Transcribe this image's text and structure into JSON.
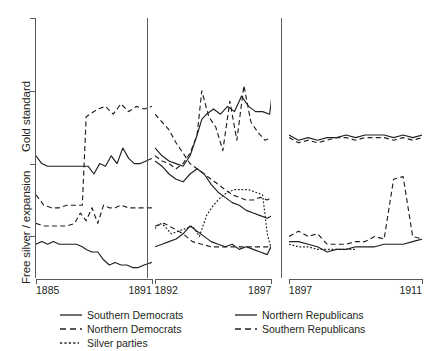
{
  "chart_data": {
    "type": "line",
    "title": "",
    "subtitle": "",
    "xlabel": "",
    "ylabel_top": "Gold standard",
    "ylabel_bottom": "Free silver / expansion",
    "ylim": [
      0,
      1
    ],
    "grid": false,
    "legend_position": "bottom",
    "axis": {
      "y_ticks": [
        1.0,
        0.72,
        0.44,
        0.16
      ],
      "y_tick_labels": [
        "",
        "",
        "",
        ""
      ],
      "y_axis_note": "Unlabeled ordinal scale: top = Gold standard, bottom = Free silver / expansion"
    },
    "panels": [
      {
        "name": "panel-1885-1891",
        "x_start_label": "1885",
        "x_end_label": "1891",
        "xlim": [
          1885,
          1891
        ],
        "series": [
          {
            "name": "Southern Democrats",
            "style": "solid",
            "x": [
              1885.0,
              1885.3,
              1885.6,
              1885.9,
              1886.2,
              1886.5,
              1886.8,
              1887.1,
              1887.4,
              1887.7,
              1888.0,
              1888.3,
              1888.6,
              1888.9,
              1889.2,
              1889.5,
              1889.8,
              1890.1,
              1890.4,
              1890.7,
              1891.0
            ],
            "values": [
              0.47,
              0.44,
              0.43,
              0.43,
              0.43,
              0.43,
              0.43,
              0.43,
              0.43,
              0.43,
              0.4,
              0.44,
              0.43,
              0.47,
              0.44,
              0.5,
              0.46,
              0.44,
              0.44,
              0.45,
              0.46
            ]
          },
          {
            "name": "Northern Democrats",
            "style": "dashed",
            "x": [
              1885.0,
              1885.4,
              1885.8,
              1886.2,
              1886.6,
              1887.0,
              1887.4,
              1887.6,
              1887.8,
              1888.2,
              1888.6,
              1889.0,
              1889.4,
              1889.8,
              1890.2,
              1890.6,
              1891.0
            ],
            "values": [
              0.32,
              0.28,
              0.27,
              0.27,
              0.28,
              0.28,
              0.28,
              0.62,
              0.63,
              0.65,
              0.66,
              0.63,
              0.67,
              0.64,
              0.66,
              0.65,
              0.66
            ]
          },
          {
            "name": "Northern Republicans",
            "style": "solid",
            "x": [],
            "values": []
          },
          {
            "name": "Southern Republicans",
            "style": "dashed",
            "x": [],
            "values": []
          },
          {
            "name": "Silver parties",
            "style": "dotted",
            "x": [],
            "values": []
          }
        ],
        "lower_series": [
          {
            "name": "Northern Democrats",
            "style": "dashed",
            "x": [
              1885.0,
              1885.4,
              1885.8,
              1886.2,
              1886.6,
              1887.0,
              1887.3,
              1887.6,
              1887.9,
              1888.2,
              1888.5,
              1888.8,
              1889.1,
              1889.4,
              1889.8,
              1890.2,
              1890.6,
              1891.0
            ],
            "values": [
              0.21,
              0.2,
              0.2,
              0.2,
              0.2,
              0.21,
              0.25,
              0.22,
              0.27,
              0.21,
              0.28,
              0.27,
              0.27,
              0.28,
              0.27,
              0.27,
              0.27,
              0.27
            ]
          },
          {
            "name": "Southern Democrats",
            "style": "solid",
            "x": [
              1885.0,
              1885.3,
              1885.6,
              1885.9,
              1886.2,
              1886.5,
              1886.8,
              1887.1,
              1887.4,
              1887.6,
              1887.9,
              1888.2,
              1888.5,
              1888.8,
              1889.1,
              1889.4,
              1889.7,
              1890.0,
              1890.3,
              1890.6,
              1891.0
            ],
            "values": [
              0.13,
              0.14,
              0.13,
              0.14,
              0.13,
              0.13,
              0.13,
              0.13,
              0.12,
              0.11,
              0.1,
              0.1,
              0.07,
              0.05,
              0.06,
              0.05,
              0.05,
              0.04,
              0.04,
              0.05,
              0.06
            ]
          }
        ]
      },
      {
        "name": "panel-1892-1897",
        "x_start_label": "1892",
        "x_end_label": "1897",
        "xlim": [
          1892,
          1897
        ],
        "series": [
          {
            "name": "Southern Republicans",
            "style": "dashed",
            "x": [
              1892.0,
              1892.3,
              1892.6,
              1892.9,
              1893.2,
              1893.5,
              1893.8,
              1894.1,
              1894.4,
              1894.7,
              1895.0,
              1895.3,
              1895.6,
              1895.9,
              1896.2,
              1896.5,
              1896.8,
              1897.0
            ],
            "values": [
              0.63,
              0.6,
              0.57,
              0.52,
              0.48,
              0.44,
              0.42,
              0.4,
              0.38,
              0.36,
              0.34,
              0.32,
              0.31,
              0.3,
              0.3,
              0.31,
              0.3,
              0.31
            ]
          },
          {
            "name": "Northern Republicans",
            "style": "solid",
            "x": [
              1892.0,
              1892.3,
              1892.6,
              1892.9,
              1893.2,
              1893.5,
              1893.8,
              1894.0,
              1894.2,
              1894.5,
              1894.8,
              1895.1,
              1895.4,
              1895.7,
              1896.0,
              1896.3,
              1896.6,
              1896.9,
              1897.0
            ],
            "values": [
              0.5,
              0.47,
              0.45,
              0.44,
              0.43,
              0.47,
              0.55,
              0.61,
              0.63,
              0.65,
              0.63,
              0.66,
              0.64,
              0.7,
              0.66,
              0.64,
              0.64,
              0.63,
              0.7
            ]
          },
          {
            "name": "Northern Democrats",
            "style": "dashed",
            "x": [
              1892.0,
              1892.3,
              1892.6,
              1892.9,
              1893.2,
              1893.5,
              1893.8,
              1894.0,
              1894.3,
              1894.6,
              1894.9,
              1895.2,
              1895.5,
              1895.8,
              1896.1,
              1896.4,
              1896.7,
              1897.0
            ],
            "values": [
              0.47,
              0.45,
              0.44,
              0.42,
              0.44,
              0.48,
              0.55,
              0.72,
              0.62,
              0.58,
              0.49,
              0.68,
              0.53,
              0.74,
              0.6,
              0.56,
              0.53,
              0.54
            ]
          },
          {
            "name": "Southern Democrats",
            "style": "solid",
            "x": [
              1892.0,
              1892.3,
              1892.6,
              1892.9,
              1893.2,
              1893.5,
              1893.8,
              1894.1,
              1894.4,
              1894.7,
              1895.0,
              1895.3,
              1895.6,
              1895.9,
              1896.2,
              1896.5,
              1896.8,
              1897.0
            ],
            "values": [
              0.45,
              0.43,
              0.4,
              0.38,
              0.37,
              0.4,
              0.42,
              0.4,
              0.36,
              0.33,
              0.31,
              0.29,
              0.28,
              0.26,
              0.25,
              0.24,
              0.23,
              0.24
            ]
          }
        ],
        "lower_series": [
          {
            "name": "Silver parties",
            "style": "dotted",
            "x": [
              1892.0,
              1892.2,
              1892.4,
              1892.7,
              1893.0,
              1893.3,
              1893.6,
              1893.9,
              1894.2,
              1894.5,
              1894.8,
              1895.1,
              1895.4,
              1895.7,
              1896.0,
              1896.3,
              1896.6,
              1896.8,
              1897.0
            ],
            "values": [
              0.19,
              0.21,
              0.2,
              0.17,
              0.18,
              0.19,
              0.2,
              0.16,
              0.24,
              0.28,
              0.31,
              0.33,
              0.34,
              0.34,
              0.34,
              0.33,
              0.32,
              0.17,
              0.1
            ]
          },
          {
            "name": "Northern Democrats",
            "style": "dashed",
            "x": [
              1892.0,
              1892.4,
              1892.8,
              1893.2,
              1893.6,
              1894.0,
              1894.4,
              1894.8,
              1895.2,
              1895.6,
              1896.0,
              1896.4,
              1896.8,
              1897.0
            ],
            "values": [
              0.2,
              0.21,
              0.19,
              0.17,
              0.14,
              0.13,
              0.12,
              0.12,
              0.12,
              0.12,
              0.12,
              0.12,
              0.12,
              0.12
            ]
          },
          {
            "name": "Southern Democrats",
            "style": "solid",
            "x": [
              1892.0,
              1892.3,
              1892.6,
              1892.9,
              1893.2,
              1893.5,
              1893.8,
              1894.1,
              1894.4,
              1894.7,
              1895.0,
              1895.3,
              1895.6,
              1895.9,
              1896.2,
              1896.5,
              1896.8,
              1897.0
            ],
            "values": [
              0.12,
              0.13,
              0.14,
              0.15,
              0.17,
              0.2,
              0.18,
              0.16,
              0.14,
              0.13,
              0.12,
              0.13,
              0.11,
              0.12,
              0.11,
              0.1,
              0.09,
              0.13
            ]
          }
        ]
      },
      {
        "name": "panel-1897-1911",
        "x_start_label": "1897",
        "x_end_label": "1911",
        "xlim": [
          1897,
          1911
        ],
        "series": [
          {
            "name": "Northern Republicans",
            "style": "solid",
            "x": [
              1897,
              1898,
              1899,
              1900,
              1901,
              1902,
              1903,
              1904,
              1905,
              1906,
              1907,
              1908,
              1909,
              1910,
              1911
            ],
            "values": [
              0.55,
              0.53,
              0.54,
              0.53,
              0.54,
              0.54,
              0.55,
              0.54,
              0.55,
              0.55,
              0.55,
              0.54,
              0.55,
              0.54,
              0.55
            ]
          },
          {
            "name": "Southern Republicans",
            "style": "dashed",
            "x": [
              1897,
              1898,
              1899,
              1900,
              1901,
              1902,
              1903,
              1904,
              1905,
              1906,
              1907,
              1908,
              1909,
              1910,
              1911
            ],
            "values": [
              0.54,
              0.52,
              0.53,
              0.52,
              0.53,
              0.54,
              0.54,
              0.53,
              0.54,
              0.54,
              0.54,
              0.53,
              0.54,
              0.53,
              0.54
            ]
          }
        ],
        "lower_series": [
          {
            "name": "Northern Democrats",
            "style": "dashed",
            "x": [
              1897,
              1898,
              1899,
              1900,
              1901,
              1902,
              1903,
              1904,
              1905,
              1906,
              1907,
              1908,
              1909,
              1910,
              1911
            ],
            "values": [
              0.16,
              0.18,
              0.16,
              0.17,
              0.13,
              0.13,
              0.13,
              0.14,
              0.14,
              0.16,
              0.15,
              0.38,
              0.39,
              0.16,
              0.15
            ]
          },
          {
            "name": "Southern Democrats",
            "style": "solid",
            "x": [
              1897,
              1898,
              1899,
              1900,
              1901,
              1902,
              1903,
              1904,
              1905,
              1906,
              1907,
              1908,
              1909,
              1910,
              1911
            ],
            "values": [
              0.14,
              0.14,
              0.13,
              0.12,
              0.1,
              0.11,
              0.11,
              0.12,
              0.12,
              0.12,
              0.13,
              0.13,
              0.13,
              0.14,
              0.15
            ]
          },
          {
            "name": "Silver parties",
            "style": "dotted",
            "x": [
              1897,
              1898,
              1899,
              1900,
              1901,
              1902,
              1903,
              1904
            ],
            "values": [
              0.13,
              0.12,
              0.12,
              0.11,
              0.11,
              0.11,
              0.11,
              0.11
            ]
          }
        ]
      }
    ],
    "legend": [
      {
        "label": "Southern Democrats",
        "style": "solid"
      },
      {
        "label": "Northern Democrats",
        "style": "dashed"
      },
      {
        "label": "Silver parties",
        "style": "dotted"
      },
      {
        "label": "Northern Republicans",
        "style": "solid"
      },
      {
        "label": "Southern Republicans",
        "style": "dashed"
      }
    ],
    "colors": {
      "line": "#231f20",
      "axis": "#58595b",
      "background": "#ffffff"
    }
  }
}
